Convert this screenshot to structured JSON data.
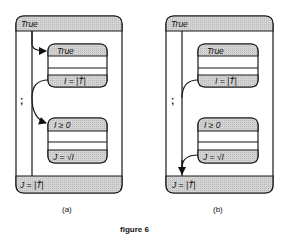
{
  "figure": {
    "caption": "figure 6",
    "colors": {
      "band_fill": "#cfcfcf",
      "stroke": "#1a1a1a",
      "background": "#ffffff"
    }
  },
  "panels": [
    {
      "id": "a",
      "label": "(a)",
      "outer_header": "True",
      "outer_footer": "J = |T̂|",
      "sequence_symbol": ";",
      "states": [
        {
          "header": "True",
          "footer": "I = |T̂|"
        },
        {
          "header": "I ≥  0",
          "footer": "J = √I"
        }
      ]
    },
    {
      "id": "b",
      "label": "(b)",
      "outer_header": "True",
      "outer_footer": "J = |T̂|",
      "sequence_symbol": ";",
      "states": [
        {
          "header": "True",
          "footer": "I = |T̂|"
        },
        {
          "header": "I ≥  0",
          "footer": "J = √I"
        }
      ]
    }
  ]
}
